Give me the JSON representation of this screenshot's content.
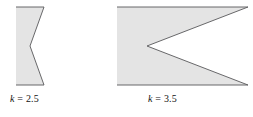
{
  "figure": {
    "background_color": "#ffffff",
    "shape_fill_color": "#e4e4e4",
    "shape_stroke_color": "#58585a",
    "text_color": "#111111",
    "panels": [
      {
        "id": "panel-left",
        "name": "cardioid-limacon-k-2-5",
        "caption": {
          "variable": "k",
          "equals": " = ",
          "value": "2.5",
          "full_text": "k = 2.5"
        },
        "outline_points": "16,7 44,7 30,46 44,85 16,85",
        "left_edge_x": 16,
        "top_y": 7,
        "bottom_y": 85,
        "notch_vertex": [
          30,
          46
        ],
        "right_x": 44
      },
      {
        "id": "panel-right",
        "name": "cardioid-limacon-k-3-5",
        "caption": {
          "variable": "k",
          "equals": " = ",
          "value": "3.5",
          "full_text": "k = 3.5"
        },
        "outline_points": "117,7 248,7 147,46 248,85 117,85",
        "left_edge_x": 117,
        "top_y": 7,
        "bottom_y": 85,
        "notch_vertex": [
          147,
          46
        ],
        "right_x": 248
      }
    ]
  }
}
